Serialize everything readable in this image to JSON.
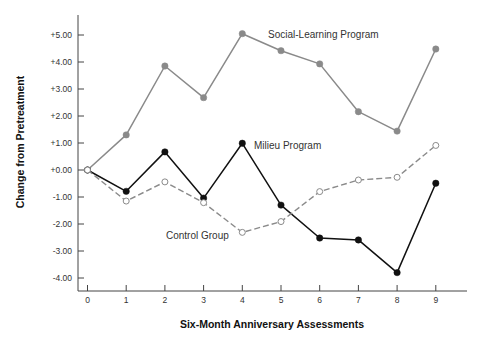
{
  "chart_data": {
    "type": "line",
    "title": "",
    "xlabel": "Six-Month Anniversary Assessments",
    "ylabel": "Change from Pretreatment",
    "x": [
      0,
      1,
      2,
      3,
      4,
      5,
      6,
      7,
      8,
      9
    ],
    "x_tick_labels": [
      "0",
      "1",
      "2",
      "3",
      "4",
      "5",
      "6",
      "7",
      "8",
      "9"
    ],
    "y_ticks": [
      5,
      4,
      3,
      2,
      1,
      0,
      -1,
      -2,
      -3,
      -4
    ],
    "y_tick_labels": [
      "+5.00",
      "+4.00",
      "+3.00",
      "+2.00",
      "+1.00",
      "+0.00",
      "-1.00",
      "-2.00",
      "-3.00",
      "-4.00"
    ],
    "ylim": [
      -4.5,
      5.7
    ],
    "xlim": [
      -0.2,
      9.8
    ],
    "grid": false,
    "legend": "inline labels",
    "series": [
      {
        "name": "Social-Learning Program",
        "values": [
          0.0,
          1.3,
          3.85,
          2.68,
          5.05,
          4.42,
          3.93,
          2.16,
          1.44,
          4.48
        ],
        "color": "#8a8a8a",
        "style": "solid",
        "marker": "filled-circle",
        "label_pos": {
          "x": 268,
          "y": 38
        }
      },
      {
        "name": "Milieu Program",
        "values": [
          0.0,
          -0.79,
          0.67,
          -1.04,
          0.99,
          -1.3,
          -2.52,
          -2.59,
          -3.8,
          -0.49
        ],
        "color": "#111111",
        "style": "solid",
        "marker": "filled-circle",
        "label_pos": {
          "x": 254,
          "y": 149
        }
      },
      {
        "name": "Control Group",
        "values": [
          0.0,
          -1.15,
          -0.44,
          -1.21,
          -2.31,
          -1.91,
          -0.8,
          -0.37,
          -0.27,
          0.91
        ],
        "color": "#8a8a8a",
        "style": "dashed",
        "marker": "open-circle",
        "label_pos": {
          "x": 166,
          "y": 239
        }
      }
    ]
  }
}
